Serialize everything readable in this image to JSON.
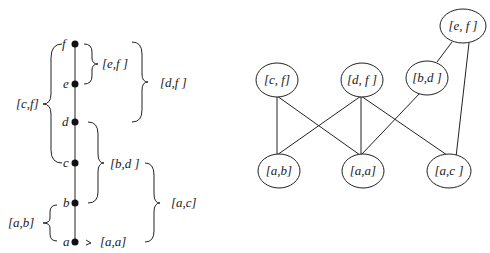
{
  "chain": {
    "points": [
      {
        "label": "f",
        "y": 44
      },
      {
        "label": "e",
        "y": 84
      },
      {
        "label": "d",
        "y": 122
      },
      {
        "label": "c",
        "y": 163
      },
      {
        "label": "b",
        "y": 203
      },
      {
        "label": "a",
        "y": 242
      }
    ],
    "intervals": [
      {
        "label": "[e,f ]"
      },
      {
        "label": "[d,f ]"
      },
      {
        "label": "[c,f]"
      },
      {
        "label": "[b,d ]"
      },
      {
        "label": "[a,c]"
      },
      {
        "label": "[a,b]"
      },
      {
        "label": "[a,a]"
      }
    ]
  },
  "graph": {
    "nodes": [
      {
        "id": "ef",
        "label": "[e, f ]"
      },
      {
        "id": "cf",
        "label": "[c, f]"
      },
      {
        "id": "df",
        "label": "[d, f ]"
      },
      {
        "id": "bd",
        "label": "[b,d ]"
      },
      {
        "id": "ab",
        "label": "[a,b]"
      },
      {
        "id": "aa",
        "label": "[a,a]"
      },
      {
        "id": "ac",
        "label": "[a,c ]"
      }
    ],
    "edges": [
      [
        "cf",
        "ab"
      ],
      [
        "cf",
        "aa"
      ],
      [
        "df",
        "ab"
      ],
      [
        "df",
        "aa"
      ],
      [
        "df",
        "ac"
      ],
      [
        "bd",
        "aa"
      ],
      [
        "ef",
        "bd"
      ],
      [
        "ef",
        "ac"
      ]
    ]
  }
}
